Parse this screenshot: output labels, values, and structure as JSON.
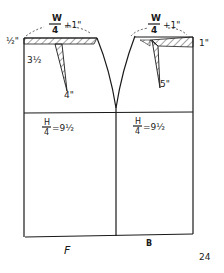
{
  "diagram": {
    "type": "skirt-pattern-draft",
    "panels": {
      "front": {
        "label": "F"
      },
      "back": {
        "label": "B"
      }
    },
    "labels": {
      "front_waist_formula_num": "W",
      "front_waist_formula_den": "4",
      "front_waist_plus": "+1\"",
      "back_waist_formula_num": "W",
      "back_waist_formula_den": "4",
      "back_waist_plus": "+1\"",
      "front_waist_drop": "½\"",
      "front_dart_depth": "3½",
      "front_dart_length": "4\"",
      "back_waist_drop": "1\"",
      "back_dart_length": "5\"",
      "front_hip_formula_num": "H",
      "front_hip_formula_den": "4",
      "front_hip_value": "=9½",
      "back_hip_formula_num": "H",
      "back_hip_formula_den": "4",
      "back_hip_value": "=9½",
      "skirt_length": "24"
    },
    "colors": {
      "ink": "#1a1a1a",
      "paper": "#ffffff"
    }
  }
}
